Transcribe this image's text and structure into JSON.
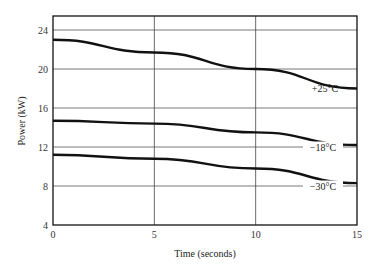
{
  "chart_data": {
    "type": "line",
    "title": "",
    "xlabel": "Time (seconds)",
    "ylabel": "Power (kW)",
    "xlim": [
      0,
      15
    ],
    "ylim": [
      4,
      25.4
    ],
    "xticks": [
      0,
      5,
      10,
      15
    ],
    "yticks": [
      4,
      8,
      12,
      16,
      20,
      24
    ],
    "grid": true,
    "legend": "inline labels",
    "x": [
      0,
      5,
      10,
      15
    ],
    "series": [
      {
        "name": "+25°C",
        "values": [
          23.0,
          21.7,
          20.0,
          18.0
        ]
      },
      {
        "name": "−18°C",
        "values": [
          14.7,
          14.4,
          13.5,
          12.2
        ]
      },
      {
        "name": "−30°C",
        "values": [
          11.2,
          10.8,
          9.8,
          8.3
        ]
      }
    ]
  },
  "labels": {
    "xlabel": "Time (seconds)",
    "ylabel": "Power (kW)",
    "series_25": "+25°C",
    "series_m18": "−18°C",
    "series_m30": "−30°C"
  },
  "ticks": {
    "x": [
      "0",
      "5",
      "10",
      "15"
    ],
    "y": [
      "4",
      "8",
      "12",
      "16",
      "20",
      "24"
    ]
  }
}
